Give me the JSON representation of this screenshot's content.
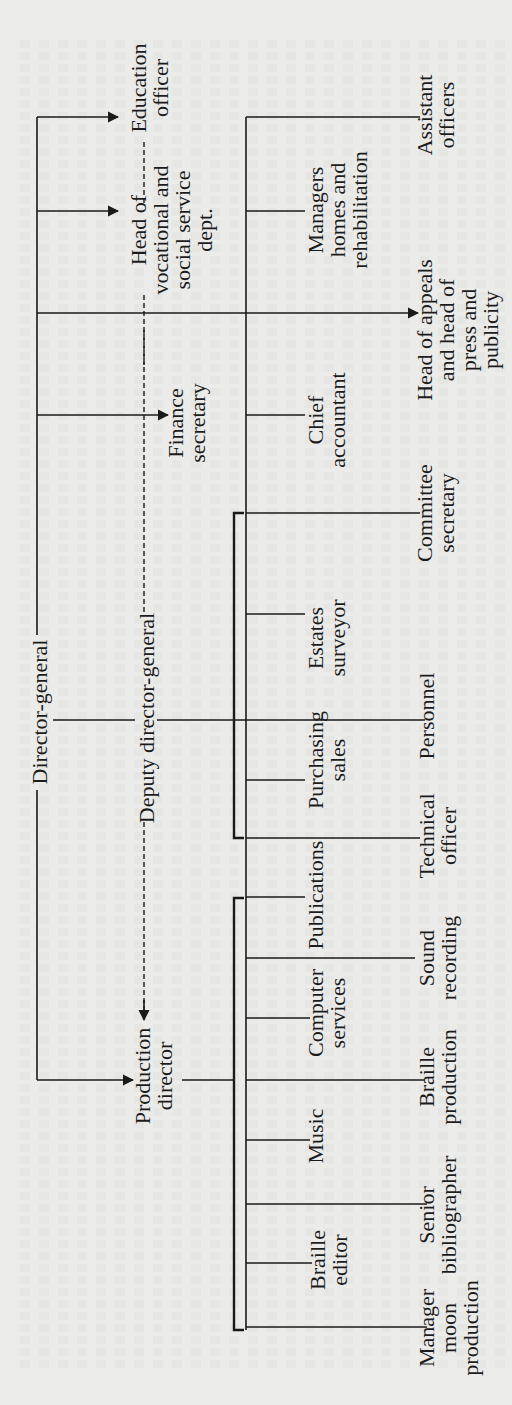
{
  "orientation": "rotated 90deg counter-clockwise",
  "chart": {
    "top": {
      "id": "director-general",
      "label": "Director-general"
    },
    "deputy": {
      "id": "deputy-director-general",
      "label": "Deputy director-general"
    },
    "direct_reports_dg": [
      {
        "id": "education-officer",
        "lines": [
          "Education",
          "officer"
        ]
      },
      {
        "id": "head-vocational",
        "lines": [
          "Head of",
          "vocational and",
          "social service",
          "dept."
        ]
      },
      {
        "id": "finance-secretary",
        "lines": [
          "Finance",
          "secretary"
        ]
      },
      {
        "id": "head-appeals",
        "lines": [
          "Head of appeals",
          "and head of",
          "press and",
          "publicity"
        ]
      },
      {
        "id": "production-director",
        "lines": [
          "Production",
          "director"
        ]
      }
    ],
    "middle_column": [
      {
        "id": "managers-homes",
        "lines": [
          "Managers",
          "homes and",
          "rehabilitation"
        ]
      },
      {
        "id": "chief-accountant",
        "lines": [
          "Chief",
          "accountant"
        ]
      },
      {
        "id": "estates-surveyor",
        "lines": [
          "Estates",
          "surveyor"
        ]
      },
      {
        "id": "purchasing-sales",
        "lines": [
          "Purchasing",
          "sales"
        ]
      },
      {
        "id": "publications",
        "lines": [
          "Publications"
        ]
      },
      {
        "id": "computer-services",
        "lines": [
          "Computer",
          "services"
        ]
      },
      {
        "id": "music",
        "lines": [
          "Music"
        ]
      },
      {
        "id": "braille-editor",
        "lines": [
          "Braille",
          "editor"
        ]
      }
    ],
    "right_column": [
      {
        "id": "assistant-officers",
        "lines": [
          "Assistant",
          "officers"
        ]
      },
      {
        "id": "committee-secretary",
        "lines": [
          "Committee",
          "secretary"
        ]
      },
      {
        "id": "personnel",
        "lines": [
          "Personnel"
        ]
      },
      {
        "id": "technical-officer",
        "lines": [
          "Technical",
          "officer"
        ]
      },
      {
        "id": "sound-recording",
        "lines": [
          "Sound",
          "recording"
        ]
      },
      {
        "id": "braille-production",
        "lines": [
          "Braille",
          "production"
        ]
      },
      {
        "id": "senior-bibliographer",
        "lines": [
          "Senior",
          "bibliographer"
        ]
      },
      {
        "id": "manager-moon",
        "lines": [
          "Manager",
          "moon",
          "production"
        ]
      }
    ]
  }
}
